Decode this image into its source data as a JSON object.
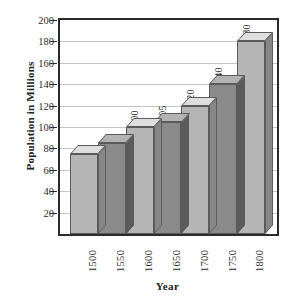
{
  "chart_data": {
    "type": "bar",
    "title": "",
    "xlabel": "Year",
    "ylabel": "Population in Millions",
    "categories": [
      "1500",
      "1550",
      "1600",
      "1650",
      "1700",
      "1750",
      "1800"
    ],
    "values": [
      75,
      85,
      100,
      105,
      120,
      140,
      180
    ],
    "data_labels": [
      "",
      "",
      "100",
      "105",
      "120",
      "140",
      "180"
    ],
    "bar_colors": [
      "#b5b5b5",
      "#8a8a8a",
      "#b5b5b5",
      "#8a8a8a",
      "#b5b5b5",
      "#8a8a8a",
      "#b5b5b5"
    ],
    "ylim": [
      0,
      200
    ],
    "yticks": [
      "20",
      "40",
      "60",
      "80",
      "100",
      "120",
      "140",
      "160",
      "180",
      "200"
    ],
    "ytick_values": [
      20,
      40,
      60,
      80,
      100,
      120,
      140,
      160,
      180,
      200
    ],
    "grid": true,
    "legend": "none",
    "style_3d": true,
    "frame_color": "#2b2b2b",
    "grid_color": "#c4c4c4",
    "background": "#ffffff"
  }
}
